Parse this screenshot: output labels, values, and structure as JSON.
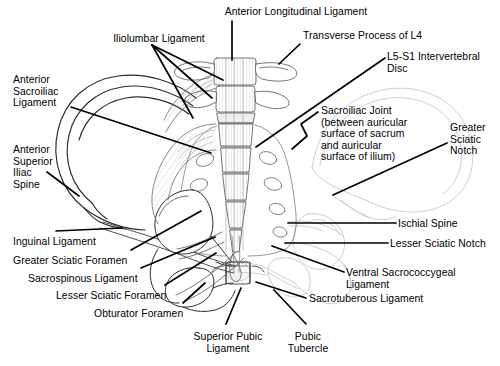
{
  "figure": {
    "background_color": "#ffffff",
    "ink_color": "#000000",
    "faded_ink_color": "#b9b9b9",
    "width": 500,
    "height": 366
  },
  "labels": [
    {
      "id": "anterior-longitudinal-ligament",
      "text": "Anterior Longitudinal Ligament",
      "align": "center",
      "x": 296,
      "y": 6,
      "lines": [
        "Anterior Longitudinal Ligament"
      ]
    },
    {
      "id": "iliolumbar-ligament",
      "text": "Iliolumbar Ligament",
      "align": "center",
      "x": 159,
      "y": 33,
      "lines": [
        "Iliolumbar Ligament"
      ]
    },
    {
      "id": "transverse-process-of-l4",
      "text": "Transverse Process of L4",
      "align": "left",
      "x": 303,
      "y": 30,
      "lines": [
        "Transverse Process of L4"
      ]
    },
    {
      "id": "l5-s1-intervertebral-disc",
      "text": "L5-S1 Intervertebral Disc",
      "align": "left",
      "x": 387,
      "y": 51,
      "lines": [
        "L5-S1 Intervertebral",
        "Disc"
      ]
    },
    {
      "id": "anterior-sacroiliac-ligament",
      "text": "Anterior Sacroiliac Ligament",
      "align": "left",
      "x": 13,
      "y": 74,
      "lines": [
        "Anterior",
        "Sacroiliac",
        "Ligament"
      ]
    },
    {
      "id": "sacroiliac-joint",
      "text": "Sacroiliac Joint (between auricular surface of sacrum and auricular surface of ilium)",
      "align": "left",
      "x": 321,
      "y": 105,
      "lines": [
        "Sacroiliac Joint",
        "(between auricular",
        "surface of sacrum",
        "and auricular",
        "surface of ilium)"
      ]
    },
    {
      "id": "greater-sciatic-notch",
      "text": "Greater Sciatic Notch",
      "align": "left",
      "x": 450,
      "y": 122,
      "lines": [
        "Greater",
        "Sciatic",
        "Notch"
      ]
    },
    {
      "id": "anterior-superior-iliac-spine",
      "text": "Anterior Superior Iliac Spine",
      "align": "left",
      "x": 13,
      "y": 144,
      "lines": [
        "Anterior",
        "Superior",
        "Iliac",
        "Spine"
      ]
    },
    {
      "id": "ischial-spine",
      "text": "Ischial Spine",
      "align": "left",
      "x": 398,
      "y": 218,
      "lines": [
        "Ischial Spine"
      ]
    },
    {
      "id": "inguinal-ligament",
      "text": "Inguinal Ligament",
      "align": "left",
      "x": 13,
      "y": 236,
      "lines": [
        "Inguinal Ligament"
      ]
    },
    {
      "id": "lesser-sciatic-notch",
      "text": "Lesser Sciatic Notch",
      "align": "left",
      "x": 390,
      "y": 238,
      "lines": [
        "Lesser Sciatic Notch"
      ]
    },
    {
      "id": "greater-sciatic-foramen",
      "text": "Greater Sciatic Foramen",
      "align": "left",
      "x": 13,
      "y": 255,
      "lines": [
        "Greater Sciatic Foramen"
      ]
    },
    {
      "id": "ventral-sacrococcygeal-ligament",
      "text": "Ventral Sacrococcygeal Ligament",
      "align": "left",
      "x": 346,
      "y": 267,
      "lines": [
        "Ventral Sacrococcygeal",
        "Ligament"
      ]
    },
    {
      "id": "sacrospinous-ligament",
      "text": "Sacrospinous Ligament",
      "align": "left",
      "x": 28,
      "y": 273,
      "lines": [
        "Sacrospinous Ligament"
      ]
    },
    {
      "id": "lesser-sciatic-foramen",
      "text": "Lesser Sciatic Foramen",
      "align": "left",
      "x": 56,
      "y": 290,
      "lines": [
        "Lesser Sciatic Foramen"
      ]
    },
    {
      "id": "sacrotuberous-ligament",
      "text": "Sacrotuberous Ligament",
      "align": "left",
      "x": 309,
      "y": 293,
      "lines": [
        "Sacrotuberous Ligament"
      ]
    },
    {
      "id": "obturator-foramen",
      "text": "Obturator Foramen",
      "align": "left",
      "x": 94,
      "y": 308,
      "lines": [
        "Obturator Foramen"
      ]
    },
    {
      "id": "superior-pubic-ligament",
      "text": "Superior Pubic Ligament",
      "align": "center",
      "x": 228,
      "y": 331,
      "lines": [
        "Superior Pubic",
        "Ligament"
      ]
    },
    {
      "id": "pubic-tubercle",
      "text": "Pubic Tubercle",
      "align": "center",
      "x": 308,
      "y": 331,
      "lines": [
        "Pubic",
        "Tubercle"
      ]
    }
  ],
  "leader_lines": [
    {
      "id": "leader-anterior-longitudinal-ligament",
      "points": "232,21 232,60"
    },
    {
      "id": "leader-iliolumbar-1",
      "points": "152,45 223,80"
    },
    {
      "id": "leader-iliolumbar-2",
      "points": "152,45 212,98"
    },
    {
      "id": "leader-iliolumbar-3",
      "points": "152,45 193,118"
    },
    {
      "id": "leader-transverse-process-l4",
      "points": "300,44 279,64"
    },
    {
      "id": "leader-l5-s1-disc",
      "points": "385,58 256,147"
    },
    {
      "id": "leader-anterior-sacroiliac-ligament",
      "points": "71,107 211,153"
    },
    {
      "id": "leader-sacroiliac-joint",
      "points": "318,112 301,124 307,136 292,149"
    },
    {
      "id": "leader-greater-sciatic-notch",
      "points": "447,143 333,195"
    },
    {
      "id": "leader-anterior-superior-iliac-spine",
      "points": "47,172 79,196"
    },
    {
      "id": "leader-ischial-spine",
      "points": "396,223 288,223"
    },
    {
      "id": "leader-inguinal-ligament",
      "points": "56,231 122,228"
    },
    {
      "id": "leader-lesser-sciatic-notch",
      "points": "388,243 285,243"
    },
    {
      "id": "leader-greater-sciatic-foramen",
      "points": "131,250 201,211"
    },
    {
      "id": "leader-ventral-sacrococcygeal-ligament",
      "points": "344,272 272,246"
    },
    {
      "id": "leader-sacrospinous-ligament",
      "points": "141,268 215,237"
    },
    {
      "id": "leader-lesser-sciatic-foramen",
      "points": "165,285 216,253"
    },
    {
      "id": "leader-sacrotuberous-ligament",
      "points": "306,298 256,282"
    },
    {
      "id": "leader-obturator-foramen",
      "points": "183,303 205,283"
    },
    {
      "id": "leader-superior-pubic-ligament",
      "points": "226,324 241,288"
    },
    {
      "id": "leader-pubic-tubercle",
      "points": "306,324 274,290"
    }
  ]
}
